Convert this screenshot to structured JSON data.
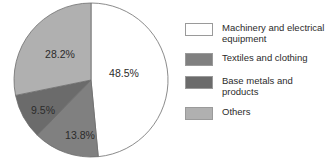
{
  "chart_data": {
    "type": "pie",
    "title": "",
    "subtitle": "",
    "xlabel": "",
    "ylabel": "",
    "legend_position": "right",
    "grid": false,
    "start_angle_deg": 0,
    "direction": "clockwise",
    "categories": [
      "Machinery and electrical equipment",
      "Textiles and clothing",
      "Base metals and products",
      "Others"
    ],
    "values": [
      48.5,
      13.8,
      9.5,
      28.2
    ],
    "value_labels": [
      "48.5%",
      "13.8%",
      "9.5%",
      "28.2%"
    ],
    "colors": [
      "#ffffff",
      "#808080",
      "#6b6b6b",
      "#b0b0b0"
    ],
    "slices": [
      {
        "label": "Machinery and electrical equipment",
        "value": 48.5,
        "value_label": "48.5%",
        "color": "#ffffff",
        "start_deg": 0,
        "end_deg": 174.6,
        "label_x": 124,
        "label_y": 74
      },
      {
        "label": "Textiles and clothing",
        "value": 13.8,
        "value_label": "13.8%",
        "color": "#808080",
        "start_deg": 174.6,
        "end_deg": 224.28,
        "label_x": 80,
        "label_y": 136
      },
      {
        "label": "Base metals and products",
        "value": 9.5,
        "value_label": "9.5%",
        "color": "#6b6b6b",
        "start_deg": 224.28,
        "end_deg": 258.48,
        "label_x": 43,
        "label_y": 111
      },
      {
        "label": "Others",
        "value": 28.2,
        "value_label": "28.2%",
        "color": "#b0b0b0",
        "start_deg": 258.48,
        "end_deg": 360,
        "label_x": 60,
        "label_y": 55
      }
    ],
    "outline_color": "#6d6d6d"
  },
  "legend": {
    "items": [
      {
        "label": "Machinery and electrical\nequipment",
        "color": "#ffffff"
      },
      {
        "label": "Textiles and clothing",
        "color": "#808080"
      },
      {
        "label": "Base metals and products",
        "color": "#6b6b6b"
      },
      {
        "label": "Others",
        "color": "#b0b0b0"
      }
    ]
  }
}
